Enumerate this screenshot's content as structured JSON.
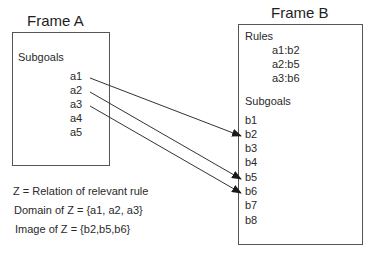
{
  "frame_a": {
    "title": "Frame A",
    "subgoals_label": "Subgoals",
    "subgoals": [
      "a1",
      "a2",
      "a3",
      "a4",
      "a5"
    ]
  },
  "frame_b": {
    "title": "Frame B",
    "rules_label": "Rules",
    "rules": [
      "a1:b2",
      "a2:b5",
      "a3:b6"
    ],
    "subgoals_label": "Subgoals",
    "subgoals": [
      "b1",
      "b2",
      "b3",
      "b4",
      "b5",
      "b6",
      "b7",
      "b8"
    ]
  },
  "arrows": [
    {
      "from": "a1",
      "to": "b2"
    },
    {
      "from": "a2",
      "to": "b5"
    },
    {
      "from": "a3",
      "to": "b6"
    }
  ],
  "notes": {
    "relation": "Z = Relation of relevant rule",
    "domain": "Domain of Z = {a1, a2, a3}",
    "image": "Image of Z = {b2,b5,b6}"
  },
  "colors": {
    "line": "#333333",
    "border": "#555555",
    "text": "#2a2a2a"
  }
}
